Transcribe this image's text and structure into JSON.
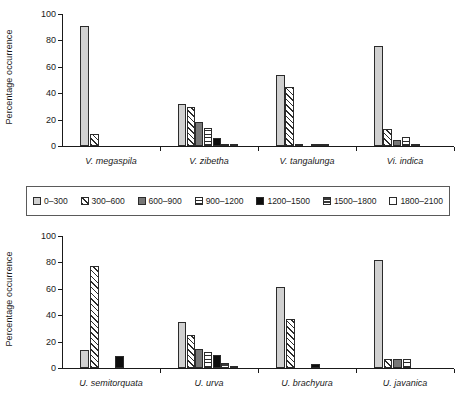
{
  "figure": {
    "background": "#ffffff",
    "legend_position": "between-panels"
  },
  "legend": {
    "items": [
      {
        "label": "0–300",
        "pattern": "solid-light-gray",
        "color": "#d0d0d0"
      },
      {
        "label": "300–600",
        "pattern": "diagonal-hatch",
        "color": "#ffffff"
      },
      {
        "label": "600–900",
        "pattern": "solid-dark-gray",
        "color": "#777777"
      },
      {
        "label": "900–1200",
        "pattern": "horizontal-lines",
        "color": "#ffffff"
      },
      {
        "label": "1200–1500",
        "pattern": "solid-black",
        "color": "#0d0d0d"
      },
      {
        "label": "1500–1800",
        "pattern": "dark-checker",
        "color": "#3a3a3a"
      },
      {
        "label": "1800–2100",
        "pattern": "solid-white",
        "color": "#ffffff"
      }
    ]
  },
  "chart_data": [
    {
      "type": "bar",
      "panel": "top",
      "title": "",
      "xlabel": "",
      "ylabel": "Percentage occurrence",
      "ylim": [
        0,
        100
      ],
      "yticks": [
        0,
        20,
        40,
        60,
        80,
        100
      ],
      "grid": false,
      "categories": [
        "V. megaspila",
        "V. zibetha",
        "V. tangalunga",
        "Vi. indica"
      ],
      "series": [
        {
          "name": "0–300",
          "values": [
            91.0,
            31.8,
            53.8,
            75.7
          ]
        },
        {
          "name": "300–600",
          "values": [
            9.4,
            29.8,
            44.5,
            13.2
          ]
        },
        {
          "name": "600–900",
          "values": [
            0,
            17.9,
            0.8,
            4.8
          ]
        },
        {
          "name": "900–1200",
          "values": [
            0,
            13.4,
            0,
            6.9
          ]
        },
        {
          "name": "1200–1500",
          "values": [
            0,
            5.9,
            1.0,
            1.8
          ]
        },
        {
          "name": "1500–1800",
          "values": [
            0,
            1.4,
            0.6,
            0
          ]
        },
        {
          "name": "1800–2100",
          "values": [
            0,
            0.3,
            0,
            0
          ]
        }
      ]
    },
    {
      "type": "bar",
      "panel": "bottom",
      "title": "",
      "xlabel": "",
      "ylabel": "Percentage occurrence",
      "ylim": [
        0,
        100
      ],
      "yticks": [
        0,
        20,
        40,
        60,
        80,
        100
      ],
      "grid": false,
      "categories": [
        "U. semitorquata",
        "U. urva",
        "U. brachyura",
        "U. javanica"
      ],
      "series": [
        {
          "name": "0–300",
          "values": [
            13.7,
            35.0,
            61.3,
            81.6
          ]
        },
        {
          "name": "300–600",
          "values": [
            77.5,
            25.0,
            36.8,
            6.6
          ]
        },
        {
          "name": "600–900",
          "values": [
            0,
            14.2,
            0,
            6.6
          ]
        },
        {
          "name": "900–1200",
          "values": [
            0,
            12.0,
            0,
            6.6
          ]
        },
        {
          "name": "1200–1500",
          "values": [
            8.8,
            9.8,
            2.8,
            0
          ]
        },
        {
          "name": "1500–1800",
          "values": [
            0,
            3.9,
            0,
            0
          ]
        },
        {
          "name": "1800–2100",
          "values": [
            0,
            1.4,
            0,
            0
          ]
        }
      ]
    }
  ]
}
